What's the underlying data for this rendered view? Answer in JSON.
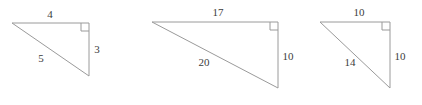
{
  "figure": {
    "background_color": "#ffffff",
    "stroke_color": "#9a9a9a",
    "label_color": "#3c3c3c",
    "triangles": [
      {
        "name": "triangle-3-4-5",
        "vertices": {
          "top_left": [
            12,
            23
          ],
          "top_right": [
            89,
            23
          ],
          "bottom_right": [
            89,
            76
          ]
        },
        "right_angle_vertex": "top_right",
        "right_angle_mark_size": 8,
        "sides": [
          {
            "name": "top-leg",
            "label": "4",
            "label_pos": [
              50,
              15
            ]
          },
          {
            "name": "right-leg",
            "label": "3",
            "label_pos": [
              97,
              50
            ]
          },
          {
            "name": "hypotenuse",
            "label": "5",
            "label_pos": [
              41,
              59
            ]
          }
        ]
      },
      {
        "name": "triangle-10-17-20",
        "vertices": {
          "top_left": [
            152,
            22
          ],
          "top_right": [
            278,
            22
          ],
          "bottom_right": [
            278,
            88
          ]
        },
        "right_angle_vertex": "top_right",
        "right_angle_mark_size": 8,
        "sides": [
          {
            "name": "top-leg",
            "label": "17",
            "label_pos": [
              218,
              13
            ]
          },
          {
            "name": "right-leg",
            "label": "10",
            "label_pos": [
              288,
              57
            ]
          },
          {
            "name": "hypotenuse",
            "label": "20",
            "label_pos": [
              204,
              63
            ]
          }
        ]
      },
      {
        "name": "triangle-10-10-14",
        "vertices": {
          "top_left": [
            320,
            22
          ],
          "top_right": [
            390,
            22
          ],
          "bottom_right": [
            390,
            88
          ]
        },
        "right_angle_vertex": "top_right",
        "right_angle_mark_size": 8,
        "sides": [
          {
            "name": "top-leg",
            "label": "10",
            "label_pos": [
              359,
              13
            ]
          },
          {
            "name": "right-leg",
            "label": "10",
            "label_pos": [
              400,
              57
            ]
          },
          {
            "name": "hypotenuse",
            "label": "14",
            "label_pos": [
              350,
              63
            ]
          }
        ]
      }
    ]
  }
}
